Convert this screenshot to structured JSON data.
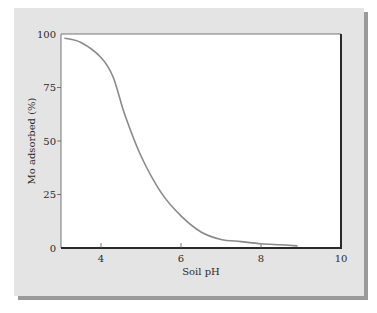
{
  "chart_data": {
    "type": "line",
    "title": "",
    "xlabel": "Soil pH",
    "ylabel": "Mo adsorbed (%)",
    "xlim": [
      3,
      10
    ],
    "ylim": [
      0,
      100
    ],
    "xticks": [
      4,
      6,
      8,
      10
    ],
    "yticks": [
      0,
      25,
      50,
      75,
      100
    ],
    "grid": false,
    "legend": null,
    "series": [
      {
        "name": "Mo adsorbed",
        "color": "#8a8a8a",
        "x": [
          3.1,
          3.5,
          4.0,
          4.3,
          4.6,
          5.0,
          5.5,
          6.0,
          6.5,
          7.0,
          7.5,
          8.0,
          8.5,
          8.9
        ],
        "y": [
          98,
          96,
          89,
          80,
          62,
          43,
          26,
          15,
          7.5,
          4,
          3,
          2,
          1.5,
          1
        ]
      }
    ]
  },
  "style": {
    "panel_bg": "#e4e4e4",
    "panel_shadow": "#9a9a9a",
    "plot_bg": "#ffffff",
    "axis_color": "#2a2a2a",
    "curve_color": "#8a8a8a"
  }
}
